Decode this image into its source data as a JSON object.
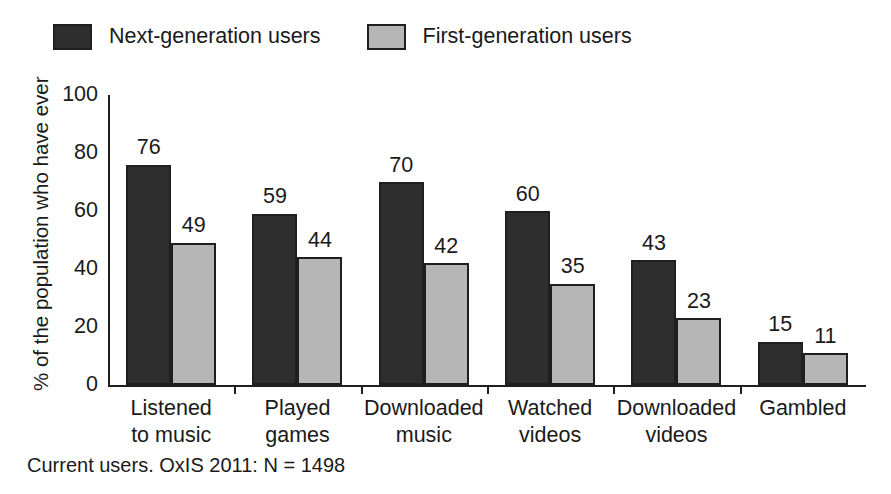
{
  "chart_data": {
    "type": "bar",
    "title": "",
    "subtitle": "",
    "xlabel": "",
    "ylabel": "% of the population who have ever",
    "ylim": [
      0,
      100
    ],
    "yticks": [
      100,
      80,
      60,
      40,
      20,
      0
    ],
    "grid": false,
    "legend_position": "top-left",
    "categories": [
      "Listened to music",
      "Played games",
      "Downloaded music",
      "Watched videos",
      "Downloaded videos",
      "Gambled"
    ],
    "category_lines": [
      [
        "Listened",
        "to music"
      ],
      [
        "Played",
        "games"
      ],
      [
        "Downloaded",
        "music"
      ],
      [
        "Watched",
        "videos"
      ],
      [
        "Downloaded",
        "videos"
      ],
      [
        "Gambled",
        ""
      ]
    ],
    "series": [
      {
        "name": "Next-generation users",
        "color": "#2e2e2e",
        "values": [
          76,
          59,
          70,
          60,
          43,
          15
        ]
      },
      {
        "name": "First-generation users",
        "color": "#b6b6b6",
        "values": [
          49,
          44,
          42,
          35,
          23,
          11
        ]
      }
    ],
    "annotation": "Current users. OxIS 2011: N = 1498"
  },
  "legend": {
    "entries": [
      {
        "label": "Next-generation users",
        "swatch": "dark"
      },
      {
        "label": "First-generation users",
        "swatch": "light"
      }
    ]
  },
  "axis": {
    "y_title": "% of the population who have ever",
    "y_ticks": [
      "100",
      "80",
      "60",
      "40",
      "20",
      "0"
    ]
  },
  "footnote": {
    "text": "Current users. OxIS 2011: N = 1498"
  }
}
